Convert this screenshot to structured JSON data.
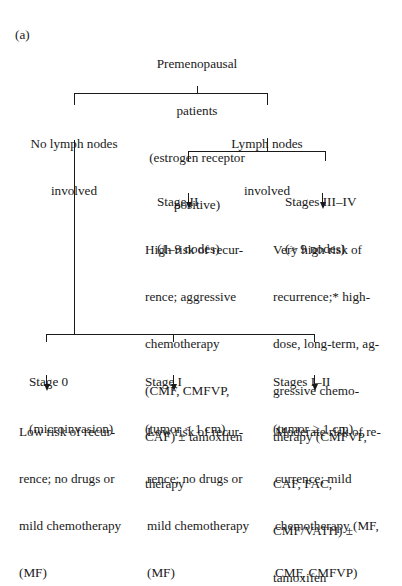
{
  "panel_label": "(a)",
  "root": {
    "lines": [
      "Premenopausal",
      "patients",
      "(estrogen receptor",
      "positive)"
    ]
  },
  "level1": {
    "no_nodes": {
      "lines": [
        "No lymph nodes",
        "involved"
      ]
    },
    "nodes": {
      "lines": [
        "Lymph nodes",
        "involved"
      ]
    }
  },
  "level2": {
    "stage2": {
      "title": [
        "Stage II",
        "(1–9 nodes)"
      ],
      "outcome": [
        "High risk of recur-",
        "rence; aggressive",
        "chemotherapy",
        "(CMF, CMFVP,",
        "CAF) ± tamoxifen",
        "therapy"
      ]
    },
    "stage34": {
      "title": [
        "Stages III–IV",
        "(> 9 nodes)"
      ],
      "outcome": [
        "Very high risk of",
        "recurrence;* high-",
        "dose, long-term, ag-",
        "gressive chemo-",
        "therapy (CMFVP,",
        "CAF, FAC,",
        "CMF/VATH) ±",
        "tamoxifen"
      ]
    }
  },
  "level3": {
    "stage0": {
      "title": [
        "Stage 0",
        "(microinvasion)"
      ],
      "outcome": [
        "Low risk of recur-",
        "rence; no drugs or",
        "mild chemotherapy",
        "(MF)"
      ]
    },
    "stage1": {
      "title": [
        "Stage I",
        "(tumor < 1 cm)"
      ],
      "outcome": [
        "Low risk of recur-",
        "rence; no drugs or",
        "mild chemotherapy",
        "(MF)"
      ]
    },
    "stage12": {
      "title": [
        "Stages I–II",
        "(tumor ≥ 1 cm)"
      ],
      "outcome": [
        "Moderate risk of re-",
        "currence; mild",
        "chemotherapy (MF,",
        "CMF, CMFVP)"
      ]
    }
  }
}
